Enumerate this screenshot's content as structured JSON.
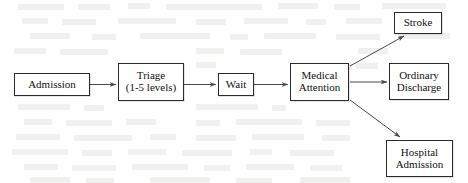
{
  "diagram": {
    "type": "flowchart",
    "canvas": {
      "width": 468,
      "height": 183
    },
    "style": {
      "background_color": "#fefefe",
      "node_border_color": "#2b2b2b",
      "node_fill_color": "#ffffff",
      "edge_color": "#4a4a4a",
      "text_color": "#111111"
    },
    "nodes": [
      {
        "id": "admission",
        "label_lines": [
          "Admission"
        ],
        "shape": "rectangle"
      },
      {
        "id": "triage",
        "label_lines": [
          "Triage",
          "(1-5 levels)"
        ],
        "shape": "rectangle"
      },
      {
        "id": "wait",
        "label_lines": [
          "Wait"
        ],
        "shape": "rectangle"
      },
      {
        "id": "medical_attention",
        "label_lines": [
          "Medical",
          "Attention"
        ],
        "shape": "rectangle"
      },
      {
        "id": "stroke",
        "label_lines": [
          "Stroke"
        ],
        "shape": "rectangle"
      },
      {
        "id": "ordinary_discharge",
        "label_lines": [
          "Ordinary",
          "Discharge"
        ],
        "shape": "rectangle"
      },
      {
        "id": "hospital_admission",
        "label_lines": [
          "Hospital",
          "Admission"
        ],
        "shape": "rectangle"
      }
    ],
    "edges": [
      {
        "from": "admission",
        "to": "triage",
        "label": "",
        "direction": "right"
      },
      {
        "from": "triage",
        "to": "wait",
        "label": "",
        "direction": "right"
      },
      {
        "from": "wait",
        "to": "medical_attention",
        "label": "",
        "direction": "right"
      },
      {
        "from": "medical_attention",
        "to": "stroke",
        "label": "",
        "direction": "up-right"
      },
      {
        "from": "medical_attention",
        "to": "ordinary_discharge",
        "label": "",
        "direction": "right"
      },
      {
        "from": "medical_attention",
        "to": "hospital_admission",
        "label": "",
        "direction": "down-right"
      }
    ]
  },
  "labels": {
    "admission": {
      "line1": "Admission"
    },
    "triage": {
      "line1": "Triage",
      "line2": "(1-5 levels)"
    },
    "wait": {
      "line1": "Wait"
    },
    "medical_attention": {
      "line1": "Medical",
      "line2": "Attention"
    },
    "stroke": {
      "line1": "Stroke"
    },
    "ordinary_discharge": {
      "line1": "Ordinary",
      "line2": "Discharge"
    },
    "hospital_admission": {
      "line1": "Hospital",
      "line2": "Admission"
    }
  }
}
